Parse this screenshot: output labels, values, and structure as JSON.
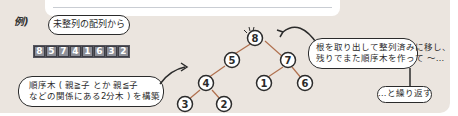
{
  "example_label": "例)",
  "bubbles": {
    "unsorted_array": "未整列の配列から",
    "build_heap_line1": "順序木 ( 親≧子 とか 親≦子",
    "build_heap_line2": "などの関係にある2分木 ) を構築",
    "extract_line1": "根を取り出して整列済みに移し、",
    "extract_line2": "残りでまた順序木を作って 〜…",
    "repeat": "…と繰り返す"
  },
  "array": {
    "values": [
      "8",
      "5",
      "7",
      "4",
      "1",
      "6",
      "3",
      "2"
    ]
  },
  "tree": {
    "nodes": [
      {
        "id": "root",
        "value": "8"
      },
      {
        "id": "l",
        "value": "5"
      },
      {
        "id": "r",
        "value": "7"
      },
      {
        "id": "ll",
        "value": "4"
      },
      {
        "id": "rl",
        "value": "1"
      },
      {
        "id": "rr",
        "value": "6"
      },
      {
        "id": "lll",
        "value": "3"
      },
      {
        "id": "llr",
        "value": "2"
      }
    ],
    "edge_color": "#b0704e"
  },
  "colors": {
    "background": "#ebe5df",
    "ink": "#2b2b2b",
    "array_cell": "#8d8f98"
  }
}
